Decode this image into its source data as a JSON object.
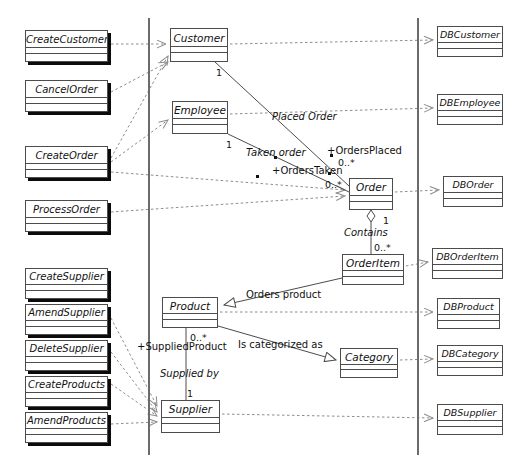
{
  "diagram": {
    "type": "uml-class-diagram",
    "stroke_color": "#4c4c4c",
    "dash_color": "#8c8c8c",
    "shadow_color": "#0b0b0b",
    "divider_color": "#6b6b6b"
  },
  "columns": {
    "boundary": {
      "label": "boundary-classes"
    },
    "entity": {
      "label": "entity-classes"
    },
    "persistence": {
      "label": "database-classes"
    }
  },
  "boundary_classes": [
    {
      "name": "CreateCustomer",
      "x": 25,
      "y": 30,
      "w": 83,
      "h": 32
    },
    {
      "name": "CancelOrder",
      "x": 25,
      "y": 80,
      "w": 83,
      "h": 32
    },
    {
      "name": "CreateOrder",
      "x": 25,
      "y": 146,
      "w": 83,
      "h": 32
    },
    {
      "name": "ProcessOrder",
      "x": 25,
      "y": 200,
      "w": 83,
      "h": 32
    },
    {
      "name": "CreateSupplier",
      "x": 25,
      "y": 268,
      "w": 83,
      "h": 31
    },
    {
      "name": "AmendSupplier",
      "x": 25,
      "y": 304,
      "w": 83,
      "h": 31
    },
    {
      "name": "DeleteSupplier",
      "x": 25,
      "y": 340,
      "w": 83,
      "h": 31
    },
    {
      "name": "CreateProducts",
      "x": 25,
      "y": 376,
      "w": 83,
      "h": 31
    },
    {
      "name": "AmendProducts",
      "x": 25,
      "y": 412,
      "w": 83,
      "h": 31
    }
  ],
  "entity_classes": [
    {
      "name": "Customer",
      "x": 170,
      "y": 28,
      "w": 58,
      "h": 34
    },
    {
      "name": "Employee",
      "x": 172,
      "y": 101,
      "w": 56,
      "h": 33
    },
    {
      "name": "Order",
      "x": 349,
      "y": 178,
      "w": 44,
      "h": 32
    },
    {
      "name": "OrderItem",
      "x": 342,
      "y": 254,
      "w": 62,
      "h": 31
    },
    {
      "name": "Product",
      "x": 162,
      "y": 297,
      "w": 56,
      "h": 31
    },
    {
      "name": "Category",
      "x": 340,
      "y": 348,
      "w": 58,
      "h": 30
    },
    {
      "name": "Supplier",
      "x": 161,
      "y": 400,
      "w": 59,
      "h": 33
    }
  ],
  "db_classes": [
    {
      "name": "DBCustomer",
      "x": 437,
      "y": 26,
      "w": 66,
      "h": 31
    },
    {
      "name": "DBEmployee",
      "x": 437,
      "y": 94,
      "w": 66,
      "h": 31
    },
    {
      "name": "DBOrder",
      "x": 443,
      "y": 176,
      "w": 60,
      "h": 31
    },
    {
      "name": "DBOrderItem",
      "x": 432,
      "y": 248,
      "w": 71,
      "h": 31
    },
    {
      "name": "DBProduct",
      "x": 437,
      "y": 298,
      "w": 63,
      "h": 31
    },
    {
      "name": "DBCategory",
      "x": 437,
      "y": 345,
      "w": 66,
      "h": 31
    },
    {
      "name": "DBSupplier",
      "x": 437,
      "y": 404,
      "w": 66,
      "h": 31
    }
  ],
  "association_labels": [
    {
      "text": "Placed Order",
      "x": 272,
      "y": 112,
      "italic": true
    },
    {
      "text": "Taken order",
      "x": 246,
      "y": 148,
      "italic": true
    },
    {
      "text": "+OrdersPlaced",
      "x": 327,
      "y": 146,
      "italic": false
    },
    {
      "text": "+OrdersTaken",
      "x": 272,
      "y": 166,
      "italic": false
    },
    {
      "text": "Contains",
      "x": 344,
      "y": 228,
      "italic": true
    },
    {
      "text": "Orders product",
      "x": 246,
      "y": 290,
      "italic": false
    },
    {
      "text": "Is categorized as",
      "x": 238,
      "y": 340,
      "italic": false
    },
    {
      "text": "+SuppliedProduct",
      "x": 137,
      "y": 342,
      "italic": false
    },
    {
      "text": "Supplied by",
      "x": 160,
      "y": 369,
      "italic": true
    }
  ],
  "multiplicities": [
    {
      "text": "1",
      "x": 216,
      "y": 68
    },
    {
      "text": "1",
      "x": 226,
      "y": 140
    },
    {
      "text": "0..*",
      "x": 338,
      "y": 158
    },
    {
      "text": "0..*",
      "x": 325,
      "y": 180
    },
    {
      "text": "1",
      "x": 383,
      "y": 216
    },
    {
      "text": "0..*",
      "x": 374,
      "y": 243
    },
    {
      "text": "0..*",
      "x": 190,
      "y": 333
    },
    {
      "text": "1",
      "x": 187,
      "y": 389
    }
  ],
  "role_markers": [
    {
      "x": 274,
      "y": 156
    },
    {
      "x": 330,
      "y": 154
    },
    {
      "x": 256,
      "y": 175
    },
    {
      "x": 328,
      "y": 172
    }
  ],
  "dividers": [
    {
      "x": 148,
      "y1": 18,
      "y2": 455
    },
    {
      "x": 417,
      "y1": 18,
      "y2": 455
    }
  ],
  "relationships": [
    {
      "kind": "dependency",
      "from": "CreateCustomer",
      "to": "Customer"
    },
    {
      "kind": "dependency",
      "from": "CancelOrder",
      "to": "Customer"
    },
    {
      "kind": "dependency",
      "from": "CreateOrder",
      "to": "Customer"
    },
    {
      "kind": "dependency",
      "from": "CreateOrder",
      "to": "Employee"
    },
    {
      "kind": "dependency",
      "from": "CreateOrder",
      "to": "Order"
    },
    {
      "kind": "dependency",
      "from": "ProcessOrder",
      "to": "Order"
    },
    {
      "kind": "dependency",
      "from": "AmendSupplier",
      "to": "Supplier"
    },
    {
      "kind": "dependency",
      "from": "DeleteSupplier",
      "to": "Supplier"
    },
    {
      "kind": "dependency",
      "from": "CreateProducts",
      "to": "Supplier"
    },
    {
      "kind": "dependency",
      "from": "AmendProducts",
      "to": "Supplier"
    },
    {
      "kind": "association",
      "from": "Customer",
      "to": "Order",
      "label": "Placed Order"
    },
    {
      "kind": "association",
      "from": "Employee",
      "to": "Order",
      "label": "Taken order"
    },
    {
      "kind": "aggregation",
      "from": "Order",
      "to": "OrderItem",
      "label": "Contains"
    },
    {
      "kind": "generalization",
      "from": "OrderItem",
      "to": "Product",
      "label": "Orders product"
    },
    {
      "kind": "generalization",
      "from": "Product",
      "to": "Category",
      "label": "Is categorized as"
    },
    {
      "kind": "association",
      "from": "Product",
      "to": "Supplier",
      "label": "Supplied by"
    },
    {
      "kind": "dependency",
      "from": "Customer",
      "to": "DBCustomer"
    },
    {
      "kind": "dependency",
      "from": "Employee",
      "to": "DBEmployee"
    },
    {
      "kind": "dependency",
      "from": "Order",
      "to": "DBOrder"
    },
    {
      "kind": "dependency",
      "from": "OrderItem",
      "to": "DBOrderItem"
    },
    {
      "kind": "dependency",
      "from": "Product",
      "to": "DBProduct"
    },
    {
      "kind": "dependency",
      "from": "Category",
      "to": "DBCategory"
    },
    {
      "kind": "dependency",
      "from": "Supplier",
      "to": "DBSupplier"
    }
  ]
}
